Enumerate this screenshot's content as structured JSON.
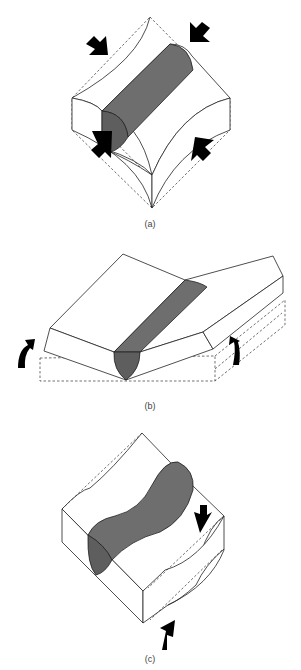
{
  "figure": {
    "panels": [
      {
        "id": "a",
        "caption": "(a)",
        "description": "Weld bead in block under biaxial compression - transverse shrinkage distortion"
      },
      {
        "id": "b",
        "caption": "(b)",
        "description": "Angular distortion - plates rotate upward about weld"
      },
      {
        "id": "c",
        "caption": "(c)",
        "description": "Buckling / shear distortion of block with curved weld"
      }
    ],
    "colors": {
      "weld_fill": "#6e6e6e",
      "outline": "#222222",
      "arrow": "#000000",
      "background": "#ffffff"
    },
    "icons": {
      "compression_arrow": "block-arrow",
      "rotation_arrow": "curved-arrow",
      "shear_arrow": "block-arrow"
    }
  }
}
